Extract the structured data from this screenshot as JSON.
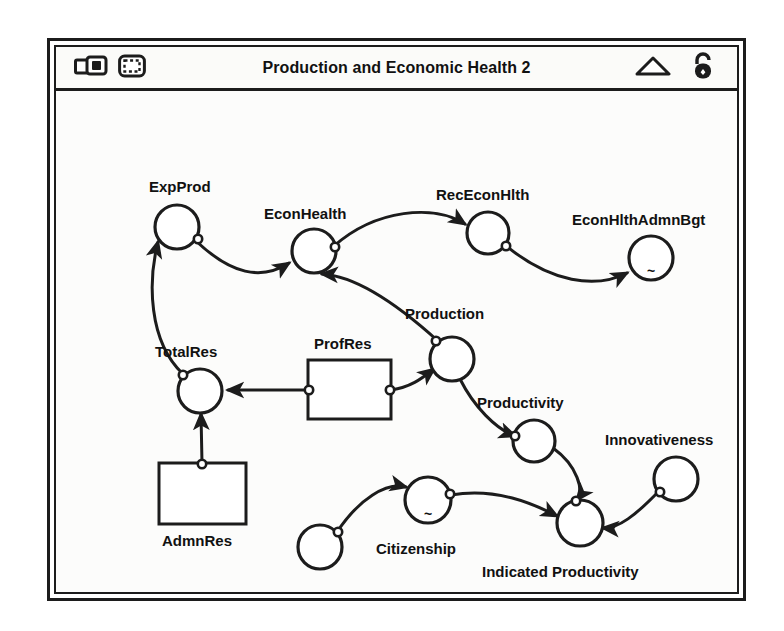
{
  "window": {
    "title": "Production and Economic Health 2",
    "tools_left": [
      {
        "name": "map-model-toggle-icon",
        "glyph": "window-stack"
      },
      {
        "name": "selection-marquee-icon",
        "glyph": "dashed-frame"
      }
    ],
    "tools_right": [
      {
        "name": "triangle-icon",
        "glyph": "triangle-outline"
      },
      {
        "name": "unlocked-padlock-icon",
        "glyph": "padlock-open"
      }
    ]
  },
  "diagram": {
    "type": "stock-and-flow",
    "stocks": [
      {
        "id": "profres",
        "label": "ProfRes",
        "x": 252,
        "y": 269,
        "w": 83,
        "h": 59,
        "label_x": 258,
        "label_y": 258
      },
      {
        "id": "admnres",
        "label": "AdmnRes",
        "x": 103,
        "y": 372,
        "w": 87,
        "h": 61,
        "label_x": 106,
        "label_y": 455
      }
    ],
    "converters": [
      {
        "id": "expprod",
        "label": "ExpProd",
        "cx": 121,
        "cy": 136,
        "r": 22,
        "label_x": 93,
        "label_y": 101,
        "graph": ""
      },
      {
        "id": "econhealth",
        "label": "EconHealth",
        "cx": 258,
        "cy": 160,
        "r": 22,
        "label_x": 208,
        "label_y": 128,
        "graph": ""
      },
      {
        "id": "receconhlth",
        "label": "RecEconHlth",
        "cx": 432,
        "cy": 142,
        "r": 21,
        "label_x": 380,
        "label_y": 109,
        "graph": ""
      },
      {
        "id": "econhlthadmnbgt",
        "label": "EconHlthAdmnBgt",
        "cx": 595,
        "cy": 167,
        "r": 22,
        "label_x": 516,
        "label_y": 134,
        "graph": "~"
      },
      {
        "id": "production",
        "label": "Production",
        "cx": 396,
        "cy": 268,
        "r": 22,
        "label_x": 349,
        "label_y": 228,
        "graph": ""
      },
      {
        "id": "totalres",
        "label": "TotalRes",
        "cx": 144,
        "cy": 300,
        "r": 22,
        "label_x": 99,
        "label_y": 266,
        "graph": ""
      },
      {
        "id": "productivity",
        "label": "Productivity",
        "cx": 478,
        "cy": 350,
        "r": 21,
        "label_x": 421,
        "label_y": 317,
        "graph": ""
      },
      {
        "id": "indprod",
        "label": "Indicated Productivity",
        "cx": 524,
        "cy": 432,
        "r": 23,
        "label_x": 426,
        "label_y": 486,
        "graph": ""
      },
      {
        "id": "innovativeness",
        "label": "Innovativeness",
        "cx": 620,
        "cy": 388,
        "r": 22,
        "label_x": 549,
        "label_y": 354,
        "graph": ""
      },
      {
        "id": "citizenship",
        "label": "Citizenship",
        "cx": 372,
        "cy": 409,
        "r": 23,
        "label_x": 320,
        "label_y": 463,
        "graph": "~"
      },
      {
        "id": "authoritarianism",
        "label": "Authoritarianism",
        "cx": 264,
        "cy": 456,
        "r": 22,
        "label_x": 180,
        "label_y": 516,
        "graph": ""
      }
    ],
    "connectors": [
      {
        "from": "totalres",
        "to": "expprod",
        "path": "M 127 283 C 92 250 92 190 102 151"
      },
      {
        "from": "expprod",
        "to": "econhealth",
        "path": "M 140 150 C 175 183 205 190 233 172"
      },
      {
        "from": "econhealth",
        "to": "receconhlth",
        "path": "M 278 155 C 320 118 378 113 409 133"
      },
      {
        "from": "receconhlth",
        "to": "econhlthadmnbgt",
        "path": "M 449 154 C 495 192 540 198 571 182"
      },
      {
        "from": "production",
        "to": "econhealth",
        "path": "M 382 250 C 340 212 300 185 266 183"
      },
      {
        "from": "profres",
        "to": "totalres",
        "path": "M 252 299 L 172 299"
      },
      {
        "from": "profres",
        "to": "production",
        "path": "M 335 299 C 355 296 365 288 378 278"
      },
      {
        "from": "admnres",
        "to": "totalres",
        "path": "M 146 372 L 145 323"
      },
      {
        "from": "production",
        "to": "productivity",
        "path": "M 404 288 C 418 316 440 338 459 345"
      },
      {
        "from": "productivity",
        "to": "indprod",
        "path": "M 497 357 C 522 375 528 400 521 409"
      },
      {
        "from": "innovativeness",
        "to": "indprod",
        "path": "M 603 400 C 580 424 562 438 547 437"
      },
      {
        "from": "citizenship",
        "to": "indprod",
        "path": "M 395 404 C 440 396 478 413 501 425"
      },
      {
        "from": "authoritarianism",
        "to": "citizenship",
        "path": "M 281 441 C 303 408 330 391 350 396"
      }
    ],
    "ports": [
      {
        "cx": 142,
        "cy": 148
      },
      {
        "cx": 127,
        "cy": 284
      },
      {
        "cx": 279,
        "cy": 156
      },
      {
        "cx": 450,
        "cy": 155
      },
      {
        "cx": 380,
        "cy": 250
      },
      {
        "cx": 253,
        "cy": 299
      },
      {
        "cx": 334,
        "cy": 299
      },
      {
        "cx": 146,
        "cy": 373
      },
      {
        "cx": 459,
        "cy": 345
      },
      {
        "cx": 520,
        "cy": 410
      },
      {
        "cx": 604,
        "cy": 401
      },
      {
        "cx": 394,
        "cy": 403
      },
      {
        "cx": 282,
        "cy": 441
      }
    ]
  }
}
